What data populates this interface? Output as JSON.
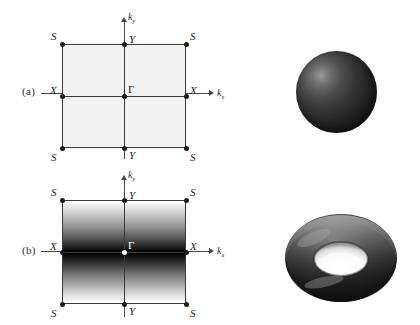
{
  "figure": {
    "background": "#ffffff",
    "width": 420,
    "height": 325,
    "line_color": "#3a3a3a",
    "point_color": "#1d1d1d",
    "panel_a_fill": "#f2f2f2",
    "manifold_color": "#333333"
  },
  "panels": [
    {
      "id": "a",
      "letter": "(a)",
      "brillouin_zone": {
        "fill_style": "uniform-light-gray",
        "gamma_point_color": "#1d1d1d",
        "axes": [
          {
            "name": "kx-axis",
            "label": "k",
            "sub": "x",
            "direction": "right"
          },
          {
            "name": "ky-axis",
            "label": "k",
            "sub": "y",
            "direction": "up"
          }
        ],
        "high_symmetry_points": [
          {
            "name": "S",
            "position": "top-left"
          },
          {
            "name": "Y",
            "position": "top-center"
          },
          {
            "name": "S",
            "position": "top-right"
          },
          {
            "name": "X",
            "position": "mid-left"
          },
          {
            "name": "Γ",
            "position": "center"
          },
          {
            "name": "X",
            "position": "mid-right"
          },
          {
            "name": "S",
            "position": "bottom-left"
          },
          {
            "name": "Y",
            "position": "bottom-center"
          },
          {
            "name": "S",
            "position": "bottom-right"
          }
        ]
      },
      "manifold": {
        "type": "sphere",
        "name": "sphere"
      }
    },
    {
      "id": "b",
      "letter": "(b)",
      "brillouin_zone": {
        "fill_style": "vertical-gradient-white-to-black-at-center",
        "gamma_point_color": "#ffffff",
        "axes": [
          {
            "name": "kx-axis",
            "label": "k",
            "sub": "x",
            "direction": "right"
          },
          {
            "name": "ky-axis",
            "label": "k",
            "sub": "y",
            "direction": "up"
          }
        ],
        "high_symmetry_points": [
          {
            "name": "S",
            "position": "top-left"
          },
          {
            "name": "Y",
            "position": "top-center"
          },
          {
            "name": "S",
            "position": "top-right"
          },
          {
            "name": "X",
            "position": "mid-left"
          },
          {
            "name": "Γ",
            "position": "center"
          },
          {
            "name": "X",
            "position": "mid-right"
          },
          {
            "name": "S",
            "position": "bottom-left"
          },
          {
            "name": "Y",
            "position": "bottom-center"
          },
          {
            "name": "S",
            "position": "bottom-right"
          }
        ]
      },
      "manifold": {
        "type": "torus",
        "name": "torus"
      }
    }
  ],
  "labels": {
    "S": "S",
    "X": "X",
    "Y": "Y",
    "gamma": "Γ",
    "k": "k",
    "sub_x": "x",
    "sub_y": "y",
    "panel_a": "(a)",
    "panel_b": "(b)"
  }
}
